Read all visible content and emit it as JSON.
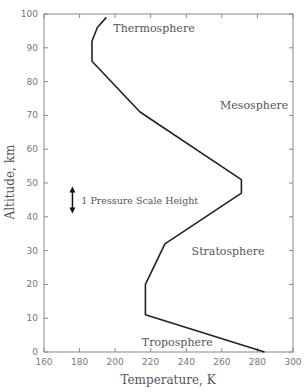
{
  "chart_data": {
    "type": "line",
    "title": "",
    "xlabel": "Temperature, K",
    "ylabel": "Altitude, km",
    "xlim": [
      160,
      300
    ],
    "ylim": [
      0,
      100
    ],
    "x_ticks": [
      160,
      180,
      200,
      220,
      240,
      260,
      280,
      300
    ],
    "y_ticks": [
      0,
      10,
      20,
      30,
      40,
      50,
      60,
      70,
      80,
      90,
      100
    ],
    "grid": false,
    "legend": null,
    "series": [
      {
        "name": "Standard atmosphere temperature profile",
        "points": [
          {
            "T": 284,
            "z": 0
          },
          {
            "T": 217,
            "z": 11
          },
          {
            "T": 217,
            "z": 20
          },
          {
            "T": 228,
            "z": 32
          },
          {
            "T": 271,
            "z": 47
          },
          {
            "T": 271,
            "z": 51
          },
          {
            "T": 214,
            "z": 71
          },
          {
            "T": 187,
            "z": 86
          },
          {
            "T": 187,
            "z": 92
          },
          {
            "T": 190,
            "z": 96
          },
          {
            "T": 195,
            "z": 99
          }
        ]
      }
    ],
    "annotations": [
      {
        "text": "Thermosphere",
        "T": 199,
        "z": 96
      },
      {
        "text": "Mesosphere",
        "T": 259,
        "z": 73
      },
      {
        "text": "Stratosphere",
        "T": 243,
        "z": 30
      },
      {
        "text": "Troposphere",
        "T": 215,
        "z": 3
      },
      {
        "text": "1 Pressure Scale Height",
        "T": 181,
        "z": 45,
        "arrow": {
          "T": 176,
          "z_from": 41,
          "z_to": 49
        }
      }
    ]
  }
}
